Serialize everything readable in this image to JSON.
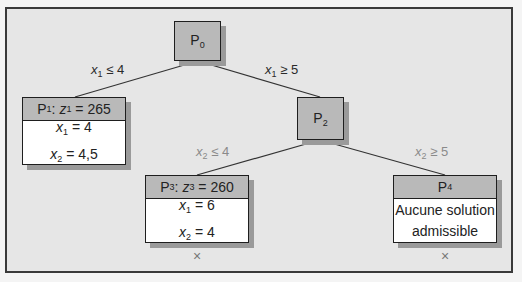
{
  "diagram": {
    "type": "branch-and-bound-tree",
    "colors": {
      "frame_border": "#3a3a3a",
      "frame_background": "#e6e6e6",
      "node_header": "#b9b9b9",
      "node_body": "#ffffff",
      "shadow": "#9a9a9a",
      "edge": "#333333",
      "light_label": "#8a8a8a"
    },
    "nodes": {
      "p0": {
        "name": "P",
        "sub": "0"
      },
      "p1": {
        "name": "P",
        "sub": "1",
        "z_var": "z",
        "z_sub": "1",
        "z_value": "265",
        "lines": [
          {
            "var": "x",
            "sub": "1",
            "value": "4"
          },
          {
            "var": "x",
            "sub": "2",
            "value": "4,5"
          }
        ]
      },
      "p2": {
        "name": "P",
        "sub": "2"
      },
      "p3": {
        "name": "P",
        "sub": "3",
        "z_var": "z",
        "z_sub": "3",
        "z_value": "260",
        "lines": [
          {
            "var": "x",
            "sub": "1",
            "value": "6"
          },
          {
            "var": "x",
            "sub": "2",
            "value": "4"
          }
        ],
        "pruned_mark": "×"
      },
      "p4": {
        "name": "P",
        "sub": "4",
        "text_line1": "Aucune solution",
        "text_line2": "admissible",
        "pruned_mark": "×"
      }
    },
    "edges": [
      {
        "from": "P0",
        "to": "P1",
        "var": "x",
        "sub": "1",
        "op": "≤",
        "value": "4"
      },
      {
        "from": "P0",
        "to": "P2",
        "var": "x",
        "sub": "1",
        "op": "≥",
        "value": "5"
      },
      {
        "from": "P2",
        "to": "P3",
        "var": "x",
        "sub": "2",
        "op": "≤",
        "value": "4"
      },
      {
        "from": "P2",
        "to": "P4",
        "var": "x",
        "sub": "2",
        "op": "≥",
        "value": "5"
      }
    ]
  }
}
